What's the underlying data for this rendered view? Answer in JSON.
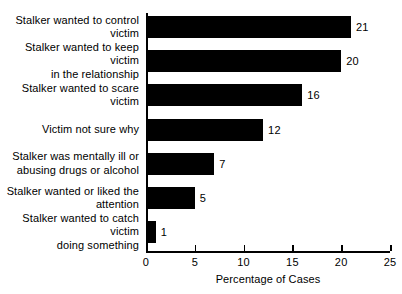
{
  "chart_data": {
    "type": "bar",
    "orientation": "horizontal",
    "title": "",
    "xlabel": "Percentage of Cases",
    "ylabel": "",
    "xlim": [
      0,
      25
    ],
    "xticks": [
      0,
      5,
      10,
      15,
      20,
      25
    ],
    "xtick_labels": [
      "0",
      "5",
      "10",
      "15",
      "20",
      "25"
    ],
    "grid": false,
    "legend": null,
    "bar_color": "#000000",
    "background_color": "#ffffff",
    "categories": [
      "Stalker wanted to control victim",
      "Stalker wanted to keep victim in the relationship",
      "Stalker wanted to scare victim",
      "Victim not sure why",
      "Stalker was mentally ill or abusing drugs or alcohol",
      "Stalker wanted or liked the attention",
      "Stalker wanted to catch victim doing something"
    ],
    "category_lines": [
      [
        "Stalker wanted to control victim"
      ],
      [
        "Stalker wanted to keep victim",
        "in the relationship"
      ],
      [
        "Stalker wanted to scare victim"
      ],
      [
        "Victim not sure why"
      ],
      [
        "Stalker was mentally ill or",
        "abusing drugs or alcohol"
      ],
      [
        "Stalker wanted or liked the",
        "attention"
      ],
      [
        "Stalker wanted to catch victim",
        "doing something"
      ]
    ],
    "values": [
      21,
      20,
      16,
      12,
      7,
      5,
      1
    ],
    "value_labels": [
      "21",
      "20",
      "16",
      "12",
      "7",
      "5",
      "1"
    ]
  },
  "axis": {
    "x_title": "Percentage of Cases",
    "ticks": [
      {
        "value": "0"
      },
      {
        "value": "5"
      },
      {
        "value": "10"
      },
      {
        "value": "15"
      },
      {
        "value": "20"
      },
      {
        "value": "25"
      }
    ]
  }
}
